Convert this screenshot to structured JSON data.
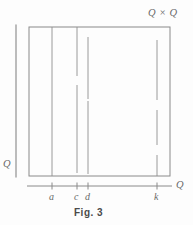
{
  "figure": {
    "caption": "Fig. 3",
    "corner_label": "Q × Q",
    "vertical_axis_label": "Q",
    "horizontal_axis_label": "Q",
    "stroke_color": "#8a8a8a",
    "text_color": "#6a6a6a",
    "background_color": "#fdfdfd"
  },
  "box": {
    "left": 29,
    "right": 170,
    "top": 27,
    "bottom": 176
  },
  "axes": {
    "vertical": {
      "x": 16,
      "y_top": 25,
      "y_bottom": 177,
      "label": "Q"
    },
    "horizontal": {
      "y": 186,
      "x_left": 27,
      "x_right": 172,
      "label": "Q"
    }
  },
  "ticks": [
    {
      "name": "a",
      "label": "a",
      "x": 52
    },
    {
      "name": "c",
      "label": "c",
      "x": 77
    },
    {
      "name": "d",
      "label": "d",
      "x": 88
    },
    {
      "name": "k",
      "label": "k",
      "x": 157
    }
  ],
  "fibers": [
    {
      "name": "fiber-a",
      "x": 52,
      "segments": [
        {
          "y1": 27,
          "y2": 176
        }
      ]
    },
    {
      "name": "fiber-c",
      "x": 77,
      "segments": [
        {
          "y1": 27,
          "y2": 76
        },
        {
          "y1": 85,
          "y2": 173
        }
      ]
    },
    {
      "name": "fiber-d",
      "x": 88,
      "segments": [
        {
          "y1": 37,
          "y2": 99
        },
        {
          "y1": 101,
          "y2": 174
        }
      ]
    },
    {
      "name": "fiber-k",
      "x": 157,
      "segments": [
        {
          "y1": 40,
          "y2": 100
        },
        {
          "y1": 110,
          "y2": 145
        },
        {
          "y1": 155,
          "y2": 176
        }
      ]
    }
  ],
  "labels": {
    "corner": {
      "text": "Q × Q",
      "x": 148,
      "y": 8
    },
    "vertical_q": {
      "text": "Q",
      "x": 3,
      "y": 159
    },
    "horizontal_q": {
      "text": "Q",
      "x": 176,
      "y": 180
    },
    "caption": {
      "text": "Fig. 3",
      "x": 74,
      "y": 207
    }
  }
}
